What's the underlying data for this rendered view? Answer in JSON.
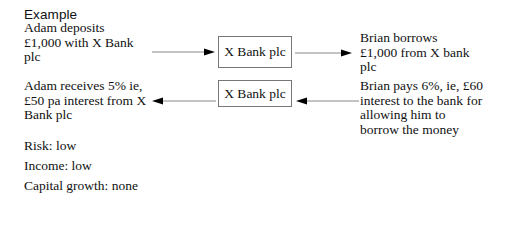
{
  "heading": "Example",
  "flows": [
    {
      "left_text": [
        "Adam deposits",
        "£1,000 with X Bank",
        "plc"
      ],
      "box_label": "X Bank plc",
      "right_text": [
        "Brian borrows",
        "£1,000 from X bank",
        "plc"
      ],
      "direction": "left-to-right"
    },
    {
      "left_text": [
        "Adam receives 5% ie,",
        "£50 pa interest from X",
        "Bank plc"
      ],
      "box_label": "X Bank plc",
      "right_text": [
        "Brian pays 6%, ie, £60",
        "interest to the bank for",
        "allowing him to",
        "borrow the money"
      ],
      "direction": "right-to-left"
    }
  ],
  "stats": [
    {
      "label": "Risk",
      "value": "low",
      "text": "Risk: low"
    },
    {
      "label": "Income",
      "value": "low",
      "text": "Income: low"
    },
    {
      "label": "Capital growth",
      "value": "none",
      "text": "Capital growth: none"
    }
  ],
  "colors": {
    "text": "#111111",
    "box_border": "#777777",
    "arrow_line": "#888888",
    "arrow_head": "#000000"
  }
}
